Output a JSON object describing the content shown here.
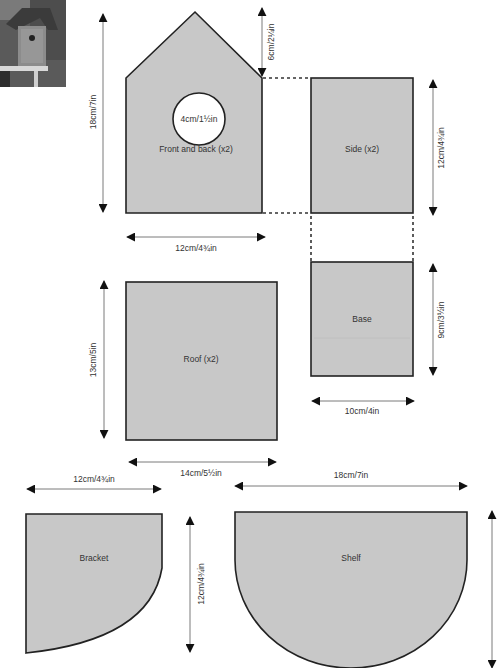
{
  "photo": {
    "description": "birdhouse-photo",
    "alt": "Finished birdhouse on a post"
  },
  "pieces": {
    "front_back": {
      "label": "Front and back (x2)",
      "hole_label": "4cm/1½in"
    },
    "side": {
      "label": "Side (x2)"
    },
    "base": {
      "label": "Base"
    },
    "roof": {
      "label": "Roof (x2)"
    },
    "bracket": {
      "label": "Bracket"
    },
    "shelf": {
      "label": "Shelf"
    }
  },
  "dimensions": {
    "front_height": "18cm/7in",
    "front_roof_peak": "6cm/2¼in",
    "front_width": "12cm/4¾in",
    "side_height": "12cm/4¾in",
    "base_height": "9cm/3½in",
    "base_width": "10cm/4in",
    "roof_height": "13cm/5in",
    "roof_width": "14cm/5½in",
    "bracket_width": "12cm/4¾in",
    "bracket_height": "12cm/4¾in",
    "shelf_width": "18cm/7in",
    "shelf_height": ""
  },
  "colors": {
    "piece_fill": "#c8c8c8",
    "outline": "#222222",
    "dimension_line": "#7a7a7a"
  }
}
